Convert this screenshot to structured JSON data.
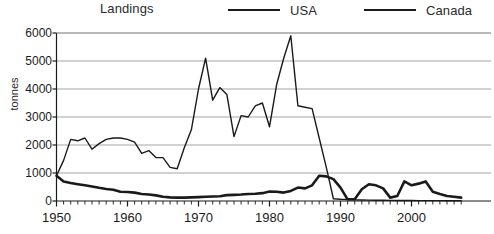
{
  "chart_title": "Landings",
  "axes": {
    "ylabel": "tonnes",
    "yticks": [
      0,
      1000,
      2000,
      3000,
      4000,
      5000,
      6000
    ],
    "ytick_labels": [
      "0",
      "1000",
      "2000",
      "3000",
      "4000",
      "5000",
      "6000"
    ],
    "xticks": [
      1950,
      1960,
      1970,
      1980,
      1990,
      2000
    ],
    "xtick_labels": [
      "1950",
      "1960",
      "1970",
      "1980",
      "1990",
      "2000"
    ]
  },
  "legend": [
    {
      "label": "USA",
      "color": "#1a1a1a"
    },
    {
      "label": "Canada",
      "color": "#1a1a1a"
    }
  ],
  "chart_data": {
    "type": "line",
    "title": "Landings",
    "xlabel": "",
    "ylabel": "tonnes",
    "xlim": [
      1950,
      2007
    ],
    "ylim": [
      0,
      6000
    ],
    "grid": true,
    "legend_position": "top-right",
    "x": [
      1950,
      1951,
      1952,
      1953,
      1954,
      1955,
      1956,
      1957,
      1958,
      1959,
      1960,
      1961,
      1962,
      1963,
      1964,
      1965,
      1966,
      1967,
      1968,
      1969,
      1970,
      1971,
      1972,
      1973,
      1974,
      1975,
      1976,
      1977,
      1978,
      1979,
      1980,
      1981,
      1982,
      1983,
      1984,
      1985,
      1986,
      1987,
      1988,
      1989,
      1990,
      1991,
      1992,
      1993,
      1994,
      1995,
      1996,
      1997,
      1998,
      1999,
      2000,
      2001,
      2002,
      2003,
      2004,
      2005,
      2006,
      2007
    ],
    "series": [
      {
        "name": "USA",
        "color": "#1a1a1a",
        "linewidth": 2.6,
        "values": [
          900,
          700,
          640,
          600,
          560,
          520,
          470,
          430,
          400,
          330,
          320,
          300,
          250,
          230,
          200,
          150,
          130,
          120,
          120,
          130,
          140,
          150,
          160,
          170,
          210,
          220,
          230,
          250,
          260,
          280,
          340,
          330,
          300,
          360,
          480,
          450,
          560,
          900,
          880,
          780,
          480,
          60,
          60,
          420,
          600,
          560,
          450,
          120,
          180,
          700,
          560,
          620,
          700,
          330,
          250,
          180,
          150,
          120
        ]
      },
      {
        "name": "Canada",
        "color": "#1a1a1a",
        "linewidth": 1.4,
        "values": [
          900,
          1450,
          2200,
          2150,
          2250,
          1850,
          2050,
          2200,
          2250,
          2250,
          2200,
          2100,
          1700,
          1800,
          1550,
          1550,
          1200,
          1150,
          1900,
          2550,
          4000,
          5100,
          3600,
          4050,
          3800,
          2300,
          3050,
          3000,
          3400,
          3500,
          2650,
          4150,
          5100,
          5900,
          3400,
          3350,
          3300,
          2250,
          1200,
          80,
          60,
          50,
          40,
          35,
          30,
          28,
          25,
          22,
          20,
          18,
          16,
          15,
          14,
          13,
          12,
          11,
          10,
          9
        ]
      }
    ]
  }
}
